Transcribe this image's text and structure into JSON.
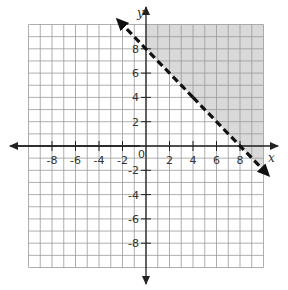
{
  "chart_data": {
    "type": "line",
    "title": "",
    "xlabel": "x",
    "ylabel": "y",
    "xlim": [
      -10,
      10
    ],
    "ylim": [
      -10,
      10
    ],
    "grid": true,
    "grid_step": 1,
    "x_tick_labels": [
      "-8",
      "-6",
      "-4",
      "-2",
      "2",
      "4",
      "6",
      "8"
    ],
    "x_ticks": [
      -8,
      -6,
      -4,
      -2,
      2,
      4,
      6,
      8
    ],
    "y_tick_labels": [
      "8",
      "6",
      "4",
      "2",
      "-2",
      "-4",
      "-6",
      "-8"
    ],
    "y_ticks": [
      8,
      6,
      4,
      2,
      -2,
      -4,
      -6,
      -8
    ],
    "origin_label": "0",
    "series": [
      {
        "name": "boundary line",
        "equation": "y = -x + 8",
        "style": "dashed",
        "arrows": "both",
        "x": [
          -2,
          10
        ],
        "y": [
          10,
          -2
        ],
        "points_on_line": [
          [
            0,
            8
          ],
          [
            8,
            0
          ]
        ]
      }
    ],
    "shaded_region": {
      "description": "region above the dashed line (y > -x + 8), right of y-axis",
      "polygon": [
        [
          0,
          8
        ],
        [
          0,
          10
        ],
        [
          10,
          10
        ],
        [
          10,
          -2
        ]
      ],
      "color": "#d9d9d9"
    }
  },
  "labels": {
    "x_axis": "x",
    "y_axis": "y",
    "origin": "0"
  },
  "colors": {
    "grid": "#9a9a9a",
    "axis": "#222222",
    "line": "#111111",
    "shade": "#d9d9d9"
  }
}
